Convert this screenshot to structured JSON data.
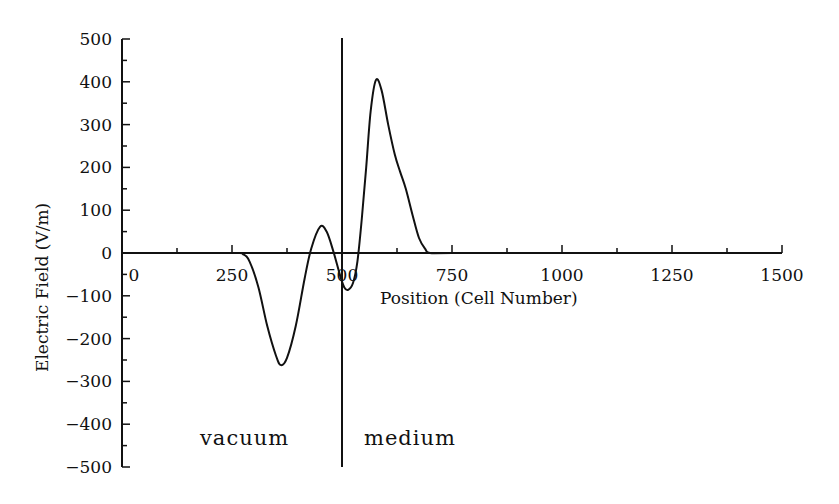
{
  "chart_data": {
    "type": "line",
    "title": "",
    "xlabel": "Position (Cell Number)",
    "ylabel": "Electric Field (V/m)",
    "xlim": [
      0,
      1500
    ],
    "ylim": [
      -500,
      500
    ],
    "x_ticks": [
      0,
      250,
      500,
      750,
      1000,
      1250,
      1500
    ],
    "y_ticks": [
      500,
      400,
      300,
      200,
      100,
      0,
      -100,
      -200,
      -300,
      -400,
      -500
    ],
    "x_tick_labels": [
      "0",
      "250",
      "500",
      "750",
      "1000",
      "1250",
      "1500"
    ],
    "y_tick_labels": [
      "500",
      "400",
      "300",
      "200",
      "100",
      "0",
      "−100",
      "−200",
      "−300",
      "−400",
      "−500"
    ],
    "grid": false,
    "legend": null,
    "series": [
      {
        "name": "Electric Field",
        "x": [
          0,
          250,
          275,
          290,
          310,
          330,
          350,
          361,
          375,
          395,
          415,
          430,
          450,
          465,
          480,
          495,
          505,
          514,
          525,
          535,
          545,
          555,
          565,
          577,
          590,
          605,
          620,
          632,
          645,
          660,
          675,
          690,
          700,
          750,
          1000,
          1250,
          1500
        ],
        "y": [
          0,
          0,
          -3,
          -20,
          -80,
          -170,
          -240,
          -262,
          -245,
          -170,
          -60,
          10,
          61,
          50,
          5,
          -50,
          -80,
          -86,
          -70,
          -20,
          80,
          200,
          330,
          404,
          380,
          300,
          230,
          190,
          150,
          90,
          35,
          8,
          0,
          0,
          0,
          0,
          0
        ]
      }
    ],
    "annotations": [
      {
        "type": "vline",
        "x": 500,
        "label": "interface"
      },
      {
        "type": "text",
        "text": "vacuum",
        "x": 250,
        "y": -430
      },
      {
        "type": "text",
        "text": "medium",
        "x": 660,
        "y": -430
      }
    ]
  },
  "labels": {
    "xlabel": "Position (Cell Number)",
    "ylabel": "Electric Field (V/m)",
    "vacuum": "vacuum",
    "medium": "medium"
  }
}
